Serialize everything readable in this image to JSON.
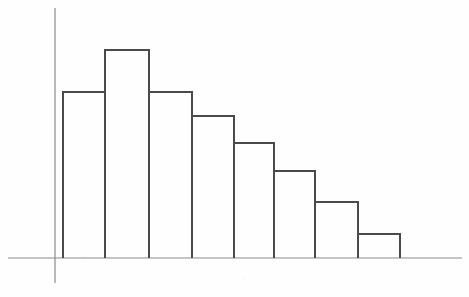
{
  "chart_data": {
    "type": "bar",
    "title": "",
    "subtitle": "",
    "xlabel": "",
    "ylabel": "",
    "categories": [
      "1",
      "2",
      "3",
      "4",
      "5",
      "6",
      "7",
      "8"
    ],
    "values": [
      166,
      208,
      166,
      142,
      115,
      87,
      56,
      24
    ],
    "tick_labels": [],
    "legend": [],
    "legend_position": "none",
    "annotations": [],
    "grid": false,
    "xlim": [
      0,
      8
    ],
    "ylim": [
      0,
      250
    ],
    "bars": [
      {
        "name": "bar-1",
        "x_left": 63,
        "x_right": 105,
        "y_top": 92,
        "value": 166
      },
      {
        "name": "bar-2",
        "x_left": 105,
        "x_right": 149,
        "y_top": 50,
        "value": 208
      },
      {
        "name": "bar-3",
        "x_left": 149,
        "x_right": 192,
        "y_top": 92,
        "value": 166
      },
      {
        "name": "bar-4",
        "x_left": 192,
        "x_right": 234,
        "y_top": 116,
        "value": 142
      },
      {
        "name": "bar-5",
        "x_left": 234,
        "x_right": 274,
        "y_top": 143,
        "value": 115
      },
      {
        "name": "bar-6",
        "x_left": 274,
        "x_right": 315,
        "y_top": 171,
        "value": 87
      },
      {
        "name": "bar-7",
        "x_left": 315,
        "x_right": 358,
        "y_top": 202,
        "value": 56
      },
      {
        "name": "bar-8",
        "x_left": 358,
        "x_right": 400,
        "y_top": 234,
        "value": 24
      }
    ],
    "baseline_y": 258,
    "axis": {
      "y_axis_x": 55,
      "y_axis_top": 8,
      "y_axis_bottom": 283,
      "x_axis_left": 8,
      "x_axis_right": 462
    },
    "colors": {
      "background": "#fefefe",
      "bar_stroke": "#4a4a4a",
      "axis_stroke": "#8a8a8a"
    }
  },
  "figure": {
    "width": 469,
    "height": 297,
    "caption": ""
  }
}
